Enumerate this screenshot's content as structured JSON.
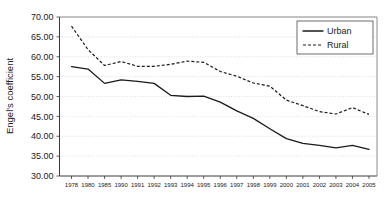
{
  "chart_data": {
    "type": "line",
    "title": "",
    "xlabel": "",
    "ylabel": "Engel's coefficient",
    "ylim": [
      30.0,
      70.0
    ],
    "ytick_step": 5.0,
    "ytick_labels": [
      "30.00",
      "35.00",
      "40.00",
      "45.00",
      "50.00",
      "55.00",
      "60.00",
      "65.00",
      "70.00"
    ],
    "ytick_values": [
      30.0,
      35.0,
      40.0,
      45.0,
      50.0,
      55.0,
      60.0,
      65.0,
      70.0
    ],
    "grid": "horizontal-dotted",
    "legend_position": "top-right",
    "categories": [
      "1978",
      "1980",
      "1985",
      "1990",
      "1991",
      "1992",
      "1993",
      "1994",
      "1995",
      "1996",
      "1997",
      "1998",
      "1999",
      "2000",
      "2001",
      "2002",
      "2003",
      "2004",
      "2005"
    ],
    "series": [
      {
        "name": "Urban",
        "style": "solid",
        "color": "#1a1a1a",
        "values": [
          57.5,
          56.9,
          53.3,
          54.2,
          53.8,
          53.3,
          50.3,
          50.0,
          50.1,
          48.6,
          46.4,
          44.5,
          41.9,
          39.4,
          38.2,
          37.7,
          37.1,
          37.7,
          36.7
        ]
      },
      {
        "name": "Rural",
        "style": "dashed",
        "color": "#1a1a1a",
        "values": [
          67.7,
          61.8,
          57.8,
          58.8,
          57.6,
          57.6,
          58.1,
          58.9,
          58.6,
          56.3,
          55.1,
          53.4,
          52.6,
          49.1,
          47.7,
          46.2,
          45.6,
          47.2,
          45.5
        ]
      }
    ],
    "legend_entries": [
      {
        "label": "Urban",
        "style": "solid"
      },
      {
        "label": "Rural",
        "style": "dashed"
      }
    ]
  }
}
